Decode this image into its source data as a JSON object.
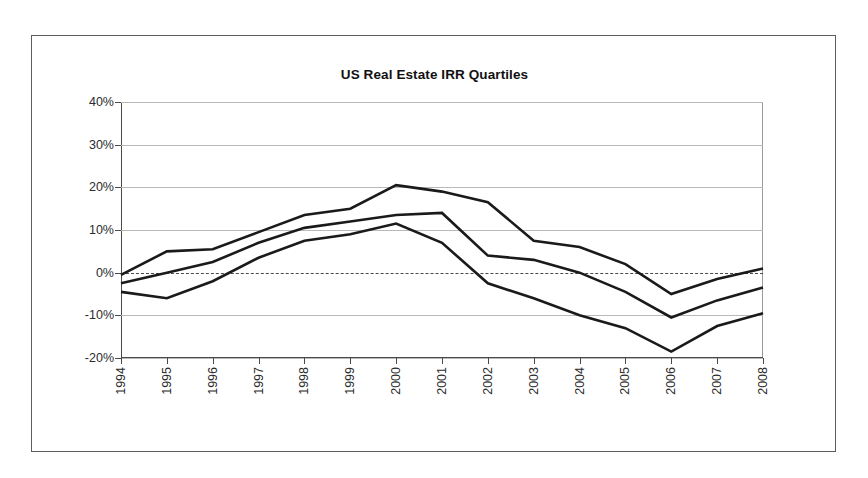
{
  "figure": {
    "title": "US Real Estate IRR Quartiles"
  },
  "axes": {
    "y_tick_labels": [
      "40%",
      "30%",
      "20%",
      "10%",
      "0%",
      "-10%",
      "-20%"
    ],
    "x_tick_labels": [
      "1994",
      "1995",
      "1996",
      "1997",
      "1998",
      "1999",
      "2000",
      "2001",
      "2002",
      "2003",
      "2004",
      "2005",
      "2006",
      "2007",
      "2008"
    ]
  },
  "colors": {
    "line": "#1a1a1a",
    "grid": "#b9b9b9",
    "zero_line": "#4a4a4a",
    "axis": "#4a4a4a",
    "frame": "#5d5d5d",
    "text": "#2b2b2b",
    "background": "#ffffff"
  },
  "chart_data": {
    "type": "line",
    "title": "US Real Estate IRR Quartiles",
    "xlabel": "",
    "ylabel": "",
    "categories": [
      "1994",
      "1995",
      "1996",
      "1997",
      "1998",
      "1999",
      "2000",
      "2001",
      "2002",
      "2003",
      "2004",
      "2005",
      "2006",
      "2007",
      "2008"
    ],
    "x": [
      1994,
      1995,
      1996,
      1997,
      1998,
      1999,
      2000,
      2001,
      2002,
      2003,
      2004,
      2005,
      2006,
      2007,
      2008
    ],
    "ylim": [
      -20,
      40
    ],
    "xlim": [
      1994,
      2008
    ],
    "y_tick_values": [
      40,
      30,
      20,
      10,
      0,
      -10,
      -20
    ],
    "y_unit": "percent",
    "grid": true,
    "legend": "none",
    "zero_line": true,
    "series": [
      {
        "name": "Upper quartile",
        "values": [
          -0.5,
          5.0,
          5.5,
          9.5,
          13.5,
          15.0,
          20.5,
          19.0,
          16.5,
          7.5,
          6.0,
          2.0,
          -5.0,
          -1.5,
          1.0
        ]
      },
      {
        "name": "Median",
        "values": [
          -2.5,
          0.0,
          2.5,
          7.0,
          10.5,
          12.0,
          13.5,
          14.0,
          4.0,
          3.0,
          0.0,
          -4.5,
          -10.5,
          -6.5,
          -3.5
        ]
      },
      {
        "name": "Lower quartile",
        "values": [
          -4.5,
          -6.0,
          -2.0,
          3.5,
          7.5,
          9.0,
          11.5,
          7.0,
          -2.5,
          -6.0,
          -10.0,
          -13.0,
          -18.5,
          -12.5,
          -9.5
        ]
      }
    ]
  }
}
